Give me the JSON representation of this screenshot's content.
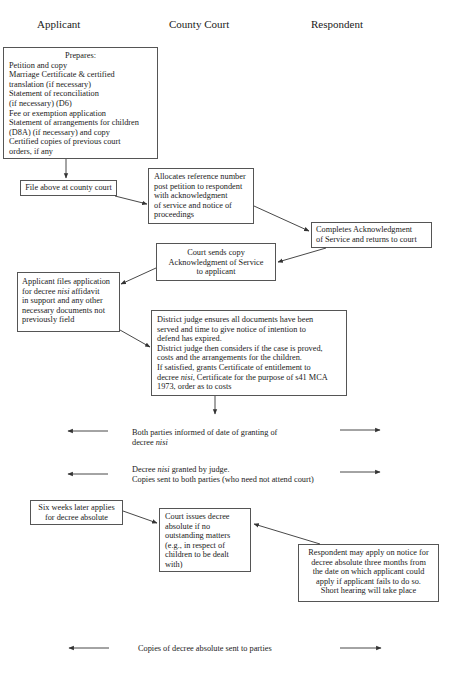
{
  "columns": {
    "applicant": "Applicant",
    "court": "County Court",
    "respondent": "Respondent"
  },
  "prepares_box": {
    "heading": "Prepares:",
    "lines": [
      "Petition and copy",
      "Marriage Certificate & certified",
      "translation (if necessary)",
      "Statement of reconciliation",
      "(if necessary) (D6)",
      "Fee or exemption application",
      "Statement of arrangements for children",
      "(D8A) (if necessary) and copy",
      "Certified copies of previous court",
      "orders, if any"
    ]
  },
  "file_box": {
    "text": "File above at county court"
  },
  "allocates_box": {
    "lines": [
      "Allocates reference number",
      "post petition to respondent",
      "with acknowledgment",
      "of service and notice of",
      "proceedings"
    ]
  },
  "completes_box": {
    "lines": [
      "Completes Acknowledgment",
      "of Service and returns to court"
    ]
  },
  "court_sends_box": {
    "lines": [
      "Court sends copy",
      "Acknowledgment of Service",
      "to applicant"
    ]
  },
  "applicant_files_box": {
    "line1": "Applicant files application",
    "line2_pre": "for decree ",
    "line2_italic": "nisi",
    "line2_post": " affidavit",
    "line3": "in support and any other",
    "line4": "necessary documents not",
    "line5": "previously field"
  },
  "district_judge_box": {
    "line1": "District judge ensures all documents have been",
    "line2": "served and time to give notice of intention to",
    "line3": "defend has expired.",
    "line4": "District judge then considers if the case is proved,",
    "line5": "costs and the arrangements for the children.",
    "line6": "If satisfied, grants Certificate of entitlement to",
    "line7_pre": "decree ",
    "line7_italic": "nisi",
    "line7_post": ", Certificate for the purpose of s41 MCA",
    "line8": "1973, order as to costs"
  },
  "informed_text": {
    "line1": "Both parties informed of date of granting of",
    "line2_pre": "decree ",
    "line2_italic": "nisi"
  },
  "granted_text": {
    "line1_pre": "Decree ",
    "line1_italic": "nisi",
    "line1_post": " granted by judge.",
    "line2": "Copies sent to both parties (who need not attend court)"
  },
  "six_weeks_box": {
    "lines": [
      "Six weeks later applies",
      "for decree absolute"
    ]
  },
  "court_issues_box": {
    "lines": [
      "Court issues decree",
      "absolute if no",
      "outstanding matters",
      "(e.g., in respect of",
      "children to be dealt",
      "with)"
    ]
  },
  "respondent_may_box": {
    "lines": [
      "Respondent may apply on notice for",
      "decree absolute three months from",
      "the date on which applicant could",
      "apply if applicant fails to do so.",
      "Short hearing will take place"
    ]
  },
  "copies_text": {
    "text": "Copies of decree absolute sent to parties"
  },
  "colors": {
    "line": "#333333",
    "border": "#555555",
    "text": "#1a1a1a"
  }
}
